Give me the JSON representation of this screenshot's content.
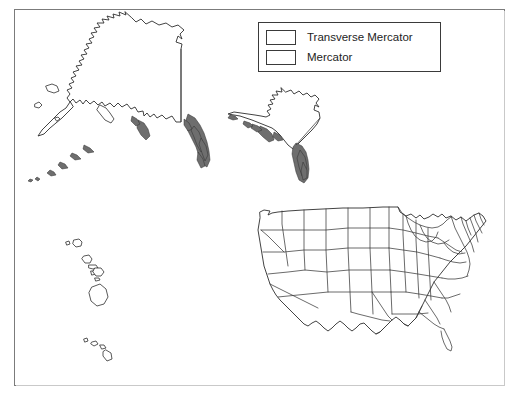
{
  "figure": {
    "frame_visible": true,
    "background_color": "#ffffff",
    "outline_color": "#2e2e2e"
  },
  "legend": {
    "title": "",
    "position": "top-right",
    "items": [
      {
        "label": "Transverse Mercator",
        "swatch_fill": "#ffffff",
        "swatch_border": "#3a3a3a"
      },
      {
        "label": "Mercator",
        "swatch_fill": "#ffffff",
        "swatch_border": "#3a3a3a"
      }
    ]
  },
  "maps": [
    {
      "id": "alaska-mercator",
      "region_label": "Alaska",
      "projection": "Mercator",
      "position": "upper-left"
    },
    {
      "id": "alaska-transverse-mercator",
      "region_label": "Alaska",
      "projection": "Transverse Mercator",
      "position": "upper-center-right"
    },
    {
      "id": "hawaii-mercator",
      "region_label": "Hawaii",
      "projection": "Mercator",
      "position": "lower-left"
    },
    {
      "id": "conus-mercator",
      "region_label": "Conterminous United States",
      "projection": "Mercator",
      "position": "lower-right",
      "features": "state boundaries"
    }
  ]
}
